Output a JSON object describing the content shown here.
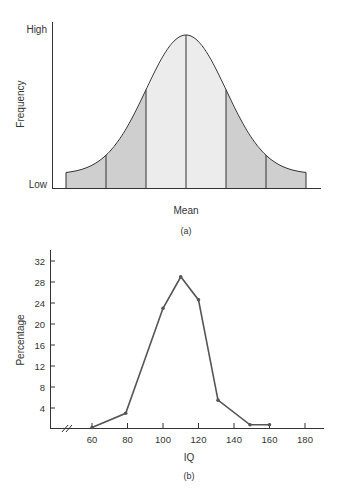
{
  "chart_data": [
    {
      "type": "area",
      "title": "",
      "caption": "(a)",
      "xlabel": "Mean",
      "ylabel": "Frequency",
      "y_tick_labels": [
        "Low",
        "High"
      ],
      "description": "Normal distribution curve divided into 6 bands by vertical lines at standard deviation intervals; the two central bands are lightly shaded, the outer bands darker",
      "bands": [
        {
          "from_sd": -3,
          "to_sd": -2,
          "shade": "dark"
        },
        {
          "from_sd": -2,
          "to_sd": -1,
          "shade": "dark"
        },
        {
          "from_sd": -1,
          "to_sd": 0,
          "shade": "light"
        },
        {
          "from_sd": 0,
          "to_sd": 1,
          "shade": "light"
        },
        {
          "from_sd": 1,
          "to_sd": 2,
          "shade": "dark"
        },
        {
          "from_sd": 2,
          "to_sd": 3,
          "shade": "dark"
        }
      ],
      "colors": {
        "dark_band": "#cfcfcf",
        "light_band": "#ececec",
        "line": "#333333"
      },
      "grid": false
    },
    {
      "type": "line",
      "title": "",
      "caption": "(b)",
      "xlabel": "IQ",
      "ylabel": "Percentage",
      "x": [
        60,
        79,
        100,
        110,
        120,
        131,
        149,
        160
      ],
      "values": [
        0.3,
        3,
        23,
        29,
        24.6,
        5.5,
        0.8,
        0.8
      ],
      "x_ticks": [
        60,
        80,
        100,
        120,
        140,
        160,
        180
      ],
      "y_ticks": [
        4,
        8,
        12,
        16,
        20,
        24,
        28,
        32
      ],
      "ylim": [
        0,
        34
      ],
      "xlim": [
        40,
        190
      ],
      "axis_break": true,
      "grid": false,
      "legend": null,
      "colors": {
        "line": "#555555"
      }
    }
  ],
  "chart_a": {
    "y_high": "High",
    "y_low": "Low",
    "ylabel": "Frequency",
    "xlabel": "Mean",
    "caption": "(a)"
  },
  "chart_b": {
    "ylabel": "Percentage",
    "xlabel": "IQ",
    "caption": "(b)",
    "y_ticks": [
      "32",
      "28",
      "24",
      "20",
      "16",
      "12",
      "8",
      "4"
    ],
    "x_ticks": [
      "60",
      "80",
      "100",
      "120",
      "140",
      "160",
      "180"
    ]
  }
}
